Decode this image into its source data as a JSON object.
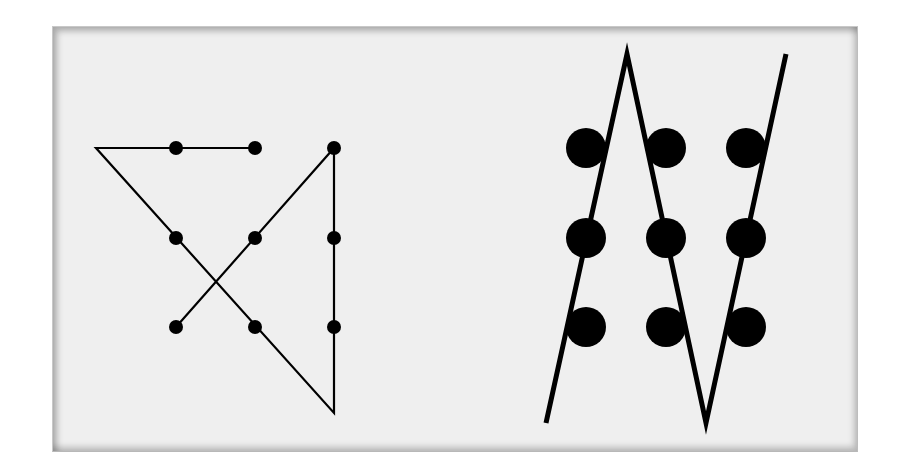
{
  "figure": {
    "background": "#efefef",
    "ink": "#000000"
  },
  "left_solution": {
    "name": "four-line solution (small dots)",
    "dot_radius": 7,
    "stroke_width": 2.2,
    "dots": [
      {
        "row": 1,
        "col": 1,
        "x": 176,
        "y": 148
      },
      {
        "row": 1,
        "col": 2,
        "x": 255,
        "y": 148
      },
      {
        "row": 1,
        "col": 3,
        "x": 334,
        "y": 148
      },
      {
        "row": 2,
        "col": 1,
        "x": 176,
        "y": 238
      },
      {
        "row": 2,
        "col": 2,
        "x": 255,
        "y": 238
      },
      {
        "row": 2,
        "col": 3,
        "x": 334,
        "y": 238
      },
      {
        "row": 3,
        "col": 1,
        "x": 176,
        "y": 327
      },
      {
        "row": 3,
        "col": 2,
        "x": 255,
        "y": 327
      },
      {
        "row": 3,
        "col": 3,
        "x": 334,
        "y": 327
      }
    ],
    "path_points": "255,148 96,148 334,413 334,148 176,327"
  },
  "right_solution": {
    "name": "three-line solution (large dots)",
    "dot_radius": 20,
    "stroke_width": 5,
    "dots": [
      {
        "row": 1,
        "col": 1,
        "x": 586,
        "y": 148
      },
      {
        "row": 1,
        "col": 2,
        "x": 666,
        "y": 148
      },
      {
        "row": 1,
        "col": 3,
        "x": 746,
        "y": 148
      },
      {
        "row": 2,
        "col": 1,
        "x": 586,
        "y": 238
      },
      {
        "row": 2,
        "col": 2,
        "x": 666,
        "y": 238
      },
      {
        "row": 2,
        "col": 3,
        "x": 746,
        "y": 238
      },
      {
        "row": 3,
        "col": 1,
        "x": 586,
        "y": 327
      },
      {
        "row": 3,
        "col": 2,
        "x": 666,
        "y": 327
      },
      {
        "row": 3,
        "col": 3,
        "x": 746,
        "y": 327
      }
    ],
    "path_points": "546,423 627,54 706,423 786,54"
  }
}
